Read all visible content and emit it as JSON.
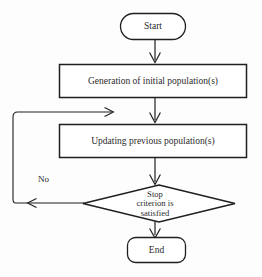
{
  "diagram": {
    "type": "flowchart",
    "background_color": "#fdfdfd",
    "stroke_color": "#1f1f1f",
    "text_color": "#2b2b2b"
  },
  "nodes": {
    "start": {
      "label": "Start",
      "shape": "stadium",
      "x": 120,
      "y": 13,
      "width": 66,
      "height": 27
    },
    "process1": {
      "label": "Generation of initial population(s)",
      "shape": "rectangle",
      "x": 59,
      "y": 64,
      "width": 188,
      "height": 34
    },
    "process2": {
      "label": "Updating previous population(s)",
      "shape": "rectangle",
      "x": 59,
      "y": 124,
      "width": 188,
      "height": 34
    },
    "decision": {
      "label": "Stop\ncriterion is\nsatisfied",
      "shape": "diamond",
      "x": 83,
      "y": 185,
      "width": 152,
      "height": 38
    },
    "end": {
      "label": "End",
      "shape": "stadium",
      "x": 127,
      "y": 237,
      "width": 59,
      "height": 26
    }
  },
  "edges": {
    "start_to_process1": {
      "label": "",
      "from": "start",
      "to": "process1"
    },
    "process1_to_process2": {
      "label": "",
      "from": "process1",
      "to": "process2"
    },
    "process2_to_decision": {
      "label": "",
      "from": "process2",
      "to": "decision"
    },
    "decision_to_end": {
      "label": "",
      "from": "decision",
      "to": "end"
    },
    "decision_loopback": {
      "label": "No",
      "from": "decision",
      "to": "process2"
    }
  }
}
